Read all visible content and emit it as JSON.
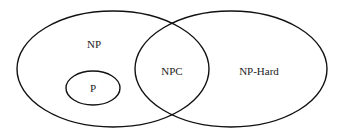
{
  "diagram": {
    "sets": [
      {
        "id": "np",
        "label": "NP"
      },
      {
        "id": "p",
        "label": "P"
      },
      {
        "id": "npc",
        "label": "NPC"
      },
      {
        "id": "nphard",
        "label": "NP-Hard"
      }
    ]
  }
}
